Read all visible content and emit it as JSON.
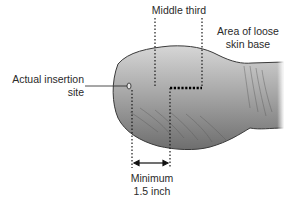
{
  "diagram": {
    "labels": {
      "middle_third": "Middle third",
      "loose_skin_line1": "Area of loose",
      "loose_skin_line2": "skin base",
      "insertion_line1": "Actual insertion",
      "insertion_line2": "site",
      "minimum_line1": "Minimum",
      "minimum_line2": "1.5 inch"
    },
    "colors": {
      "body_light": "#c8c8c8",
      "body_dark": "#7a7a7a",
      "outline": "#3a3a3a",
      "text": "#2a2a2a",
      "dotted": "#1a1a1a"
    }
  }
}
